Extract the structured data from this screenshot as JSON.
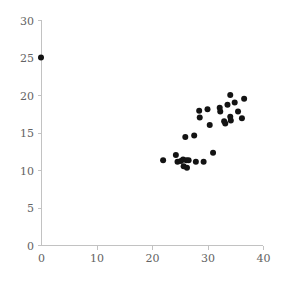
{
  "chart_data": {
    "type": "scatter",
    "title": "",
    "xlabel": "",
    "ylabel": "",
    "xlim": [
      0,
      40
    ],
    "ylim": [
      0,
      30
    ],
    "xticks": [
      0,
      10,
      20,
      30,
      40
    ],
    "yticks": [
      0,
      5,
      10,
      15,
      20,
      25,
      30
    ],
    "xtick_labels": [
      "0",
      "10",
      "20",
      "30",
      "40"
    ],
    "ytick_labels": [
      "0",
      "5",
      "10",
      "15",
      "20",
      "25",
      "30"
    ],
    "grid": false,
    "legend": null,
    "marker": "circle",
    "marker_color": "#131313",
    "marker_size": 3,
    "axis_color": "#c2c2c2",
    "label_color": "#636363",
    "background_color": "#ffffff",
    "points": [
      [
        0.0,
        25.0
      ],
      [
        22.0,
        11.3
      ],
      [
        24.3,
        12.0
      ],
      [
        24.6,
        11.1
      ],
      [
        25.2,
        11.2
      ],
      [
        25.6,
        11.4
      ],
      [
        25.7,
        10.5
      ],
      [
        26.2,
        11.3
      ],
      [
        26.3,
        10.3
      ],
      [
        26.6,
        11.3
      ],
      [
        26.0,
        14.4
      ],
      [
        27.6,
        14.6
      ],
      [
        27.9,
        11.1
      ],
      [
        29.3,
        11.1
      ],
      [
        28.5,
        17.9
      ],
      [
        28.6,
        17.0
      ],
      [
        30.0,
        18.1
      ],
      [
        30.4,
        16.0
      ],
      [
        31.0,
        12.3
      ],
      [
        32.3,
        17.8
      ],
      [
        32.2,
        18.3
      ],
      [
        33.0,
        16.5
      ],
      [
        33.2,
        16.2
      ],
      [
        33.6,
        18.7
      ],
      [
        34.1,
        20.0
      ],
      [
        34.2,
        16.6
      ],
      [
        34.1,
        17.1
      ],
      [
        34.9,
        19.0
      ],
      [
        35.5,
        17.8
      ],
      [
        36.2,
        16.9
      ],
      [
        36.6,
        19.5
      ]
    ]
  },
  "plot_geometry": {
    "origin_x_px": 41,
    "origin_y_px": 245,
    "x_axis_end_px": 263,
    "y_axis_top_px": 20
  }
}
